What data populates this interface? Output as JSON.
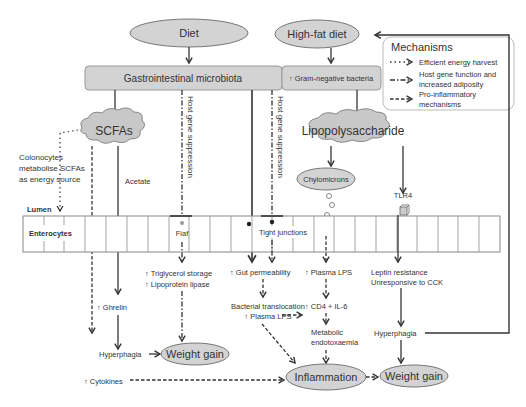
{
  "nodes": {
    "diet": "Diet",
    "high_fat_diet": "High-fat diet",
    "gi_microbiota": "Gastrointestinal microbiota",
    "gram_negative": "↑ Gram-negative bacteria",
    "scfas": "SCFAs",
    "lipopolysaccharide": "Lipopolysaccharide",
    "chylomicrons": "Chylomicrons",
    "colonocytes_1": "Colonocytes",
    "colonocytes_2": "metabolise SCFAs",
    "colonocytes_3": "as energy source",
    "acetate": "Acetate",
    "host_gene_suppression_1": "Host gene suppression",
    "host_gene_suppression_2": "Host gene suppression",
    "tlr4": "TLR4",
    "lumen": "Lumen",
    "enterocytes": "Enterocytes",
    "fiaf": "Fiaf",
    "tight_junctions": "Tight junctions",
    "triglycerol_storage": "↑ Triglycerol storage",
    "lipoprotein_lipase": "↑ Lipoprotein lipase",
    "gut_permeability": "↑ Gut permeability",
    "plasma_lps_1": "↑ Plasma LPS",
    "leptin_resistance": "Leptin resistance",
    "unresponsive_cck": "Unresponsive to CCK",
    "ghrelin": "↑ Ghrelin",
    "bacterial_translocation": "Bacterial translocation",
    "plasma_lps_2": "↑ Plasma LPS",
    "cd4_il6": "↑ CD4 + IL-6",
    "metabolic_1": "Metabolic",
    "metabolic_2": "endotoxaemia",
    "hyperphagia_left": "Hyperphagia",
    "hyperphagia_right": "Hyperphagia",
    "weight_gain_left": "Weight gain",
    "weight_gain_right": "Weight gain",
    "cytokines": "↑ Cytokines",
    "inflammation": "Inflammation"
  },
  "legend": {
    "title": "Mechanisms",
    "items": [
      {
        "style": "dotted",
        "label_1": "Efficient energy harvest",
        "label_2": ""
      },
      {
        "style": "dash-dot",
        "label_1": "Host gene function and",
        "label_2": "increased adiposity"
      },
      {
        "style": "dashed",
        "label_1": "Pro-inflammatory",
        "label_2": "mechanisms"
      }
    ]
  },
  "colors": {
    "node_fill": "#d3d3d3",
    "node_stroke": "#777777",
    "line": "#333333",
    "cell_stroke": "#999999"
  }
}
